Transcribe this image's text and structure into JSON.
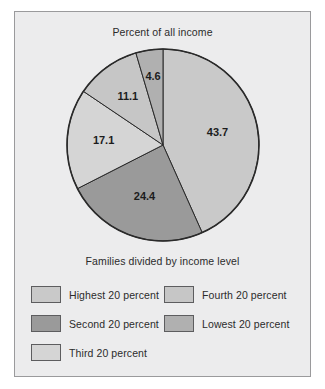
{
  "figure": {
    "title": "Percent of all income",
    "legend_title": "Families divided by income level",
    "background_color": "#ececed",
    "border_color": "#9a9a9c"
  },
  "chart_data": {
    "type": "pie",
    "title": "Percent of all income",
    "subtitle": "Families divided by income level",
    "unit": "percent",
    "start_angle_deg": 0,
    "direction": "clockwise",
    "legend_position": "bottom",
    "categories": [
      "Highest 20 percent",
      "Second 20 percent",
      "Third 20 percent",
      "Fourth 20 percent",
      "Lowest 20 percent"
    ],
    "values": [
      43.7,
      24.4,
      17.1,
      11.1,
      4.6
    ],
    "labels": [
      "43.7",
      "24.4",
      "17.1",
      "11.1",
      "4.6"
    ],
    "colors": [
      "#c9c9c9",
      "#9a9a9a",
      "#d5d5d5",
      "#c6c6c6",
      "#b0b0b0"
    ],
    "slices": [
      {
        "name": "Highest 20 percent",
        "value": 43.7,
        "label": "43.7",
        "color": "#c9c9c9"
      },
      {
        "name": "Second 20 percent",
        "value": 24.4,
        "label": "24.4",
        "color": "#9a9a9a"
      },
      {
        "name": "Third 20 percent",
        "value": 17.1,
        "label": "17.1",
        "color": "#d5d5d5"
      },
      {
        "name": "Fourth 20 percent",
        "value": 11.1,
        "label": "11.1",
        "color": "#c6c6c6"
      },
      {
        "name": "Lowest 20 percent",
        "value": 4.6,
        "label": "4.6",
        "color": "#b0b0b0"
      }
    ]
  },
  "legend": {
    "items": [
      {
        "label": "Highest 20 percent",
        "color": "#c9c9c9"
      },
      {
        "label": "Fourth 20 percent",
        "color": "#c6c6c6"
      },
      {
        "label": "Second 20 percent",
        "color": "#9a9a9a"
      },
      {
        "label": "Lowest 20 percent",
        "color": "#b0b0b0"
      },
      {
        "label": "Third 20 percent",
        "color": "#d5d5d5"
      }
    ]
  }
}
